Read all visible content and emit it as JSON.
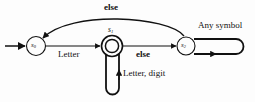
{
  "diagram": {
    "type": "finite-state-machine",
    "title": "",
    "colors": {
      "stroke": "#111111",
      "background": "#fdfdfd",
      "text": "#111111"
    },
    "states": [
      {
        "id": "s0",
        "label": "s",
        "subscript": "0",
        "kind": "start",
        "x": 36,
        "y": 46,
        "r": 9.5
      },
      {
        "id": "s1",
        "label": "s",
        "subscript": "1",
        "kind": "accepting-double-circle",
        "x": 112,
        "y": 46,
        "r": 10.5
      },
      {
        "id": "s2",
        "label": "s",
        "subscript": "2",
        "kind": "normal",
        "x": 186,
        "y": 46,
        "r": 9.0
      }
    ],
    "transitions": [
      {
        "from": "start-arrow",
        "to": "s0",
        "label": ""
      },
      {
        "from": "s0",
        "to": "s1",
        "label": "Letter",
        "bold": false
      },
      {
        "from": "s1",
        "to": "s2",
        "label": "else",
        "bold": true
      },
      {
        "from": "s2",
        "to": "s0",
        "label": "else",
        "bold": true,
        "shape": "arc-over-top"
      },
      {
        "from": "s1",
        "to": "s1",
        "label": "Letter, digit",
        "bold": false,
        "shape": "self-loop-below-stadium"
      },
      {
        "from": "s2",
        "to": "s2",
        "label": "Any symbol",
        "bold": false,
        "shape": "self-loop-right-stadium"
      }
    ],
    "labels": {
      "else_top": "else",
      "else_mid": "else",
      "letter": "Letter",
      "letter_digit": "Letter, digit",
      "any_symbol": "Any symbol"
    }
  }
}
